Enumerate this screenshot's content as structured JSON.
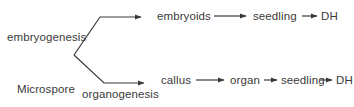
{
  "diagram": {
    "colors": {
      "background": "#ffffff",
      "line": "#3a3a3a",
      "text": "#3a3a3a"
    },
    "nodes": {
      "microspore": "Microspore",
      "embryogenesis": "embryogenesis",
      "organogenesis": "organogenesis",
      "embryoids": "embryoids",
      "seedling_top": "seedling",
      "dh_top": "DH",
      "callus": "callus",
      "organ": "organ",
      "seedling_bottom": "seedling",
      "dh_bottom": "DH"
    },
    "connectors": [
      {
        "name": "microspore-to-embryoids",
        "kind": "elbow-arrow"
      },
      {
        "name": "microspore-to-callus",
        "kind": "elbow-arrow"
      },
      {
        "name": "embryoids-to-seedling",
        "kind": "straight-arrow"
      },
      {
        "name": "seedling-to-dh-top",
        "kind": "straight-arrow"
      },
      {
        "name": "callus-to-organ",
        "kind": "straight-arrow"
      },
      {
        "name": "organ-to-seedling",
        "kind": "straight-arrow"
      },
      {
        "name": "seedling-to-dh-bottom",
        "kind": "straight-arrow"
      }
    ]
  }
}
